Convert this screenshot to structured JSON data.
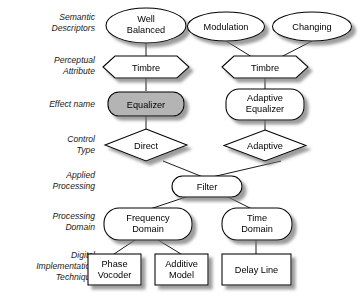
{
  "diagram": {
    "background_color": "#ffffff",
    "stroke_color": "#000000",
    "highlight_fill": "#b4b4b4",
    "default_fill": "#ffffff",
    "row_labels": [
      {
        "id": "semantic-descriptors",
        "line1": "Semantic",
        "line2": "Descriptors"
      },
      {
        "id": "perceptual-attribute",
        "line1": "Perceptual",
        "line2": "Attribute"
      },
      {
        "id": "effect-name",
        "line1": "Effect name",
        "line2": ""
      },
      {
        "id": "control-type",
        "line1": "Control",
        "line2": "Type"
      },
      {
        "id": "applied-processing",
        "line1": "Applied",
        "line2": "Processing"
      },
      {
        "id": "processing-domain",
        "line1": "Processing",
        "line2": "Domain"
      },
      {
        "id": "digital-implementation-technique",
        "line1": "Digital",
        "line2": "Implementation",
        "line3": "Technique"
      }
    ],
    "nodes": [
      {
        "id": "well-balanced",
        "line1": "Well",
        "line2": "Balanced",
        "shape": "ellipse",
        "fill": "#ffffff",
        "row": "semantic-descriptors"
      },
      {
        "id": "modulation",
        "line1": "Modulation",
        "line2": "",
        "shape": "ellipse",
        "fill": "#ffffff",
        "row": "semantic-descriptors"
      },
      {
        "id": "changing",
        "line1": "Changing",
        "line2": "",
        "shape": "ellipse",
        "fill": "#ffffff",
        "row": "semantic-descriptors"
      },
      {
        "id": "timbre-left",
        "line1": "Timbre",
        "line2": "",
        "shape": "hexagon",
        "fill": "#ffffff",
        "row": "perceptual-attribute"
      },
      {
        "id": "timbre-right",
        "line1": "Timbre",
        "line2": "",
        "shape": "hexagon",
        "fill": "#ffffff",
        "row": "perceptual-attribute"
      },
      {
        "id": "equalizer",
        "line1": "Equalizer",
        "line2": "",
        "shape": "rounded-rect",
        "fill": "#b4b4b4",
        "row": "effect-name"
      },
      {
        "id": "adaptive-equalizer",
        "line1": "Adaptive",
        "line2": "Equalizer",
        "shape": "rounded-rect",
        "fill": "#ffffff",
        "row": "effect-name"
      },
      {
        "id": "direct",
        "line1": "Direct",
        "line2": "",
        "shape": "diamond",
        "fill": "#ffffff",
        "row": "control-type"
      },
      {
        "id": "adaptive",
        "line1": "Adaptive",
        "line2": "",
        "shape": "diamond",
        "fill": "#ffffff",
        "row": "control-type"
      },
      {
        "id": "filter",
        "line1": "Filter",
        "line2": "",
        "shape": "rounded-rect",
        "fill": "#ffffff",
        "row": "applied-processing"
      },
      {
        "id": "frequency-domain",
        "line1": "Frequency",
        "line2": "Domain",
        "shape": "rounded-rect",
        "fill": "#ffffff",
        "row": "processing-domain"
      },
      {
        "id": "time-domain",
        "line1": "Time",
        "line2": "Domain",
        "shape": "rounded-rect",
        "fill": "#ffffff",
        "row": "processing-domain"
      },
      {
        "id": "phase-vocoder",
        "line1": "Phase",
        "line2": "Vocoder",
        "shape": "rect",
        "fill": "#ffffff",
        "row": "digital-implementation-technique"
      },
      {
        "id": "additive-model",
        "line1": "Additive",
        "line2": "Model",
        "shape": "rect",
        "fill": "#ffffff",
        "row": "digital-implementation-technique"
      },
      {
        "id": "delay-line",
        "line1": "Delay Line",
        "line2": "",
        "shape": "rect",
        "fill": "#ffffff",
        "row": "digital-implementation-technique"
      }
    ],
    "edges": [
      {
        "from": "well-balanced",
        "to": "timbre-left"
      },
      {
        "from": "modulation",
        "to": "timbre-right"
      },
      {
        "from": "changing",
        "to": "timbre-right"
      },
      {
        "from": "timbre-left",
        "to": "equalizer"
      },
      {
        "from": "timbre-right",
        "to": "adaptive-equalizer"
      },
      {
        "from": "equalizer",
        "to": "direct"
      },
      {
        "from": "adaptive-equalizer",
        "to": "adaptive"
      },
      {
        "from": "direct",
        "to": "filter"
      },
      {
        "from": "adaptive",
        "to": "filter"
      },
      {
        "from": "filter",
        "to": "frequency-domain"
      },
      {
        "from": "filter",
        "to": "time-domain"
      },
      {
        "from": "frequency-domain",
        "to": "phase-vocoder"
      },
      {
        "from": "frequency-domain",
        "to": "additive-model"
      },
      {
        "from": "time-domain",
        "to": "delay-line"
      }
    ]
  }
}
